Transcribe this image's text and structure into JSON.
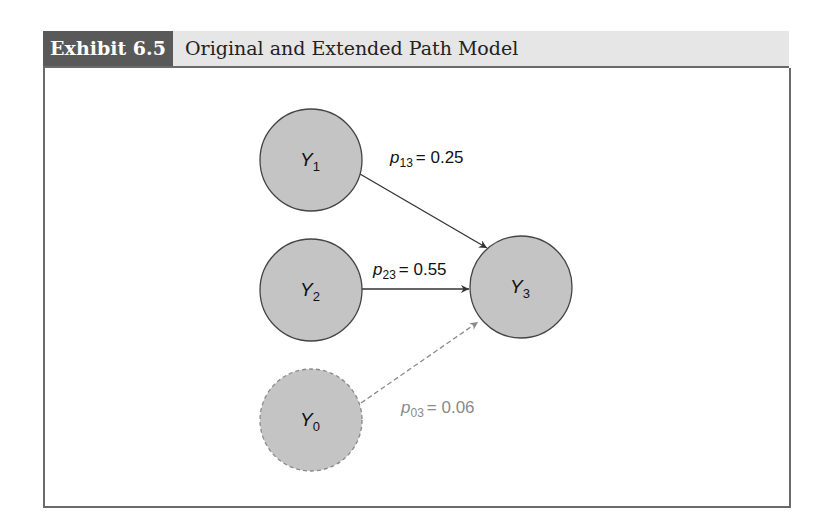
{
  "header": {
    "tag": "Exhibit 6.5",
    "title": "Original and Extended Path Model"
  },
  "nodes": [
    {
      "id": "Y1",
      "label": "Y",
      "sub": "1",
      "cx": 311,
      "cy": 160,
      "r": 51,
      "style": "solid"
    },
    {
      "id": "Y2",
      "label": "Y",
      "sub": "2",
      "cx": 311,
      "cy": 290,
      "r": 51,
      "style": "solid"
    },
    {
      "id": "Y3",
      "label": "Y",
      "sub": "3",
      "cx": 521,
      "cy": 287,
      "r": 51,
      "style": "solid"
    },
    {
      "id": "Y0",
      "label": "Y",
      "sub": "0",
      "cx": 311,
      "cy": 420,
      "r": 51,
      "style": "dashed"
    }
  ],
  "edges": [
    {
      "from": "Y1",
      "to": "Y3",
      "label": "p",
      "sub": "13",
      "value": "= 0.25",
      "style": "solid"
    },
    {
      "from": "Y2",
      "to": "Y3",
      "label": "p",
      "sub": "23",
      "value": "= 0.55",
      "style": "solid"
    },
    {
      "from": "Y0",
      "to": "Y3",
      "label": "p",
      "sub": "03",
      "value": "= 0.06",
      "style": "dashed"
    }
  ],
  "colors": {
    "node_fill": "#c4c4c4",
    "node_stroke": "#444444",
    "dashed_stroke": "#8a8a8a",
    "header_tag_bg": "#595959",
    "header_bg": "#e6e6e6"
  }
}
